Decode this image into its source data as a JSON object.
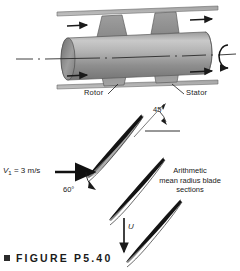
{
  "figure": {
    "caption": "FIGURE P5.40",
    "caption_bullet": "square-bullet",
    "labels": {
      "rotor": "Rotor",
      "stator": "Stator",
      "angle_45": "45°",
      "angle_60": "60°",
      "inlet_velocity_symbol": "V",
      "inlet_velocity_subscript": "1",
      "inlet_velocity_value": " = 3 m/s",
      "blade_speed": "U",
      "blade_section_note_line1": "Arithmetic",
      "blade_section_note_line2": "mean radius blade",
      "blade_section_note_line3": "sections"
    },
    "icons": {
      "flow_arrow": "right-arrow-icon",
      "rotation_arrow": "rotation-arrow-icon",
      "velocity_arrow": "right-arrow-icon",
      "blade_speed_arrow": "down-arrow-icon",
      "centerline": "dash-dot-centerline-icon"
    },
    "colors": {
      "line": "#1a1a1a",
      "blade_fill_dark": "#8c8c8c",
      "blade_fill_light": "#b4b4b4",
      "shaft_light": "#cfcfcf",
      "shaft_mid": "#a8a8a8",
      "shaft_dark": "#7a7a7a",
      "duct_fill": "#b0b0b0",
      "background": "#ffffff"
    }
  }
}
